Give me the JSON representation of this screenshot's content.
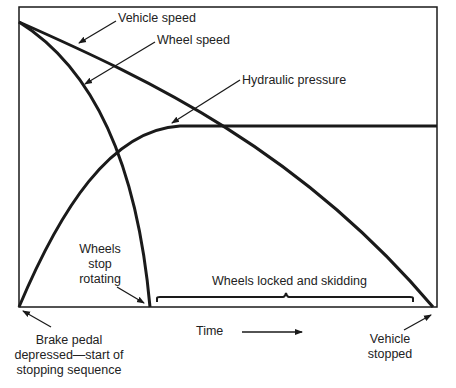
{
  "diagram": {
    "curves": [
      {
        "name": "Vehicle speed",
        "shape": "gently curving line from start (top-left) down to vehicle stopped (bottom-right)"
      },
      {
        "name": "Wheel speed",
        "shape": "steeply falling curve from start (top-left) to zero where wheels stop rotating"
      },
      {
        "name": "Hydraulic pressure",
        "shape": "rises from zero at brake pedal press and plateaus across remaining time"
      }
    ],
    "labels": {
      "vehicle_speed": "Vehicle speed",
      "wheel_speed": "Wheel speed",
      "hydraulic_pressure": "Hydraulic pressure",
      "wheels_stop_line1": "Wheels",
      "wheels_stop_line2": "stop",
      "wheels_stop_line3": "rotating",
      "locked_skidding": "Wheels locked and skidding",
      "time_axis": "Time",
      "brake_line1": "Brake pedal",
      "brake_line2": "depressed—start of",
      "brake_line3": "stopping sequence",
      "stopped_line1": "Vehicle",
      "stopped_line2": "stopped"
    },
    "colors": {
      "line": "#1a1a1a",
      "background": "#ffffff"
    }
  }
}
